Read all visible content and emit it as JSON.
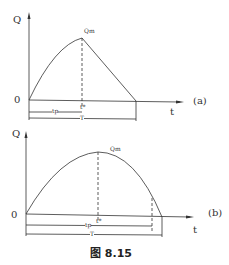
{
  "figure": {
    "caption": "图 8.15",
    "panel_a": {
      "tag": "(a)",
      "y_axis_label": "Q",
      "x_axis_label": "t",
      "origin_label": "0",
      "peak_label": "Qm",
      "peak_time_label": "t*",
      "rise_label": "tp",
      "total_label": "T"
    },
    "panel_b": {
      "tag": "(b)",
      "y_axis_label": "Q",
      "x_axis_label": "t",
      "origin_label": "0",
      "peak_label": "Qm",
      "peak_time_label": "t*",
      "rise_label": "tp",
      "total_label": "T"
    }
  }
}
